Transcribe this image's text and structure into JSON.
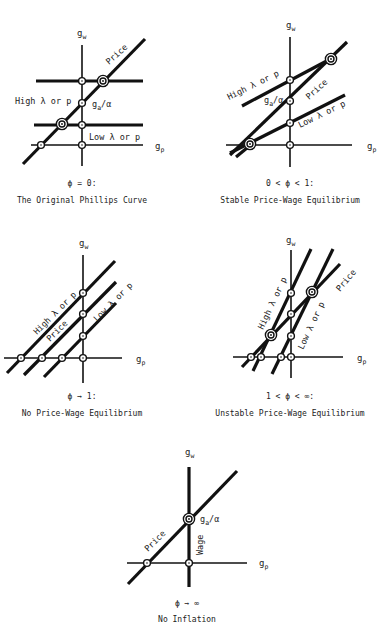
{
  "figure": {
    "panels": [
      {
        "id": "original-phillips",
        "condition": "ϕ = 0:",
        "title": "The Original Phillips Curve",
        "y_axis": "g",
        "y_axis_sub": "w",
        "x_axis": "g",
        "x_axis_sub": "p",
        "labels": {
          "price": "Price",
          "high": "High λ or p",
          "low": "Low λ or p",
          "ga": "g",
          "ga_sub": "a",
          "ga_suffix": "/α"
        }
      },
      {
        "id": "stable-equilibrium",
        "condition": "0 < ϕ < 1:",
        "title": "Stable Price-Wage Equilibrium",
        "y_axis": "g",
        "y_axis_sub": "w",
        "x_axis": "g",
        "x_axis_sub": "p",
        "labels": {
          "price": "Price",
          "high": "High λ or p",
          "low": "Low λ or p",
          "ga": "g",
          "ga_sub": "a",
          "ga_suffix": "/α"
        }
      },
      {
        "id": "no-equilibrium",
        "condition": "ϕ → 1:",
        "title": "No Price-Wage Equilibrium",
        "y_axis": "g",
        "y_axis_sub": "w",
        "x_axis": "g",
        "x_axis_sub": "p",
        "labels": {
          "price": "Price",
          "high": "High λ or p",
          "low": "Low λ or p"
        }
      },
      {
        "id": "unstable-equilibrium",
        "condition": "1 < ϕ < ∞:",
        "title": "Unstable Price-Wage Equilibrium",
        "y_axis": "g",
        "y_axis_sub": "w",
        "x_axis": "g",
        "x_axis_sub": "p",
        "labels": {
          "price": "Price",
          "high": "High λ or p",
          "low": "Low λ or p"
        }
      },
      {
        "id": "no-inflation",
        "condition": "ϕ → ∞",
        "title": "No Inflation",
        "y_axis": "g",
        "y_axis_sub": "w",
        "x_axis": "g",
        "x_axis_sub": "p",
        "labels": {
          "price": "Price",
          "wage": "Wage",
          "ga": "g",
          "ga_sub": "a",
          "ga_suffix": "/α"
        }
      }
    ]
  }
}
